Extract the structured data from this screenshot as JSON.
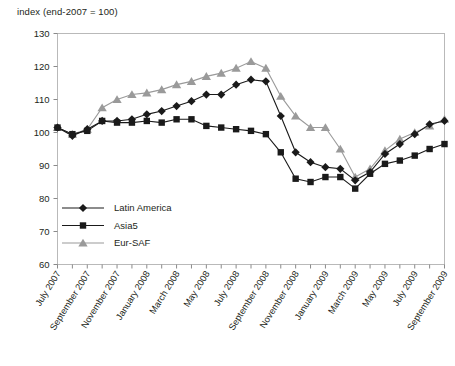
{
  "chart_data": {
    "type": "line",
    "title": "index (end-2007 = 100)",
    "xlabel": "",
    "ylabel": "index (end-2007 = 100)",
    "ylim": [
      60,
      130
    ],
    "ytick_values": [
      60,
      70,
      80,
      90,
      100,
      110,
      120,
      130
    ],
    "grid": false,
    "legend_position": "inside-lower-left",
    "x": [
      "July 2007",
      "August 2007",
      "September 2007",
      "October 2007",
      "November 2007",
      "December 2007",
      "January 2008",
      "February 2008",
      "March 2008",
      "April 2008",
      "May 2008",
      "June 2008",
      "July 2008",
      "August 2008",
      "September 2008",
      "October 2008",
      "November 2008",
      "December 2008",
      "January 2009",
      "February 2009",
      "March 2009",
      "April 2009",
      "May 2009",
      "June 2009",
      "July 2009",
      "August 2009",
      "September 2009"
    ],
    "xtick_labels": [
      "July 2007",
      "September 2007",
      "November 2007",
      "January 2008",
      "March 2008",
      "May 2008",
      "July 2008",
      "September 2008",
      "November 2008",
      "January 2009",
      "March 2009",
      "May 2009",
      "July 2009",
      "September 2009"
    ],
    "series": [
      {
        "name": "Latin America",
        "marker": "diamond",
        "color": "#1a1a1a",
        "values": [
          101.5,
          99.0,
          101.0,
          103.5,
          103.5,
          104.0,
          105.5,
          106.5,
          108.0,
          109.5,
          111.5,
          111.5,
          114.5,
          116.0,
          115.5,
          105.0,
          94.0,
          91.0,
          89.5,
          89.0,
          85.5,
          88.0,
          93.5,
          96.5,
          99.5,
          102.5,
          103.5
        ]
      },
      {
        "name": "Asia5",
        "marker": "square",
        "color": "#1a1a1a",
        "values": [
          101.5,
          99.5,
          100.5,
          103.5,
          103.0,
          103.0,
          103.5,
          103.0,
          104.0,
          104.0,
          102.0,
          101.5,
          101.0,
          100.5,
          99.5,
          94.0,
          86.0,
          85.0,
          86.5,
          86.5,
          83.0,
          87.5,
          90.5,
          91.5,
          93.0,
          95.0,
          96.5
        ]
      },
      {
        "name": "Eur-SAF",
        "marker": "triangle",
        "color": "#9a9a9a",
        "values": [
          101.5,
          99.5,
          101.0,
          107.5,
          110.0,
          111.5,
          112.0,
          113.0,
          114.5,
          115.5,
          117.0,
          118.0,
          119.5,
          121.5,
          119.5,
          111.0,
          105.0,
          101.5,
          101.5,
          95.0,
          86.5,
          89.0,
          94.5,
          98.0,
          100.0,
          102.0,
          104.0
        ]
      }
    ]
  },
  "legend": {
    "items": [
      {
        "label": "Latin America"
      },
      {
        "label": "Asia5"
      },
      {
        "label": "Eur-SAF"
      }
    ]
  }
}
